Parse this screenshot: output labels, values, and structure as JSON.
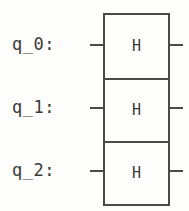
{
  "diagram": {
    "kind": "quantum-circuit",
    "qubit_count": 3,
    "column_count": 1,
    "colors": {
      "background": "#fdfdfb",
      "ink": "#3a3a3a",
      "wire": "#4a4a4a",
      "gate_border": "#4a4a4a",
      "gate_fill": "#fdfdfb"
    },
    "qubits": [
      {
        "label": "q_0:"
      },
      {
        "label": "q_1:"
      },
      {
        "label": "q_2:"
      }
    ],
    "gates": [
      {
        "name": "H",
        "qubit": "q_0:",
        "gate_type": "hadamard"
      },
      {
        "name": "H",
        "qubit": "q_1:",
        "gate_type": "hadamard"
      },
      {
        "name": "H",
        "qubit": "q_2:",
        "gate_type": "hadamard"
      }
    ]
  }
}
